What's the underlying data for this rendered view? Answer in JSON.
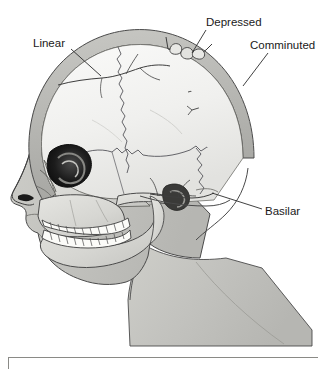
{
  "figure": {
    "background_color": "#ffffff",
    "width": 326,
    "height": 369
  },
  "labels": [
    {
      "id": "linear",
      "text": "Linear",
      "x": 33,
      "y": 47,
      "anchor": "start",
      "leader": {
        "x1": 71,
        "y1": 49,
        "x2": 101,
        "y2": 76
      }
    },
    {
      "id": "depressed",
      "text": "Depressed",
      "x": 206,
      "y": 26,
      "anchor": "start",
      "leader": {
        "x1": 206,
        "y1": 30,
        "x2": 192,
        "y2": 53
      }
    },
    {
      "id": "comminuted",
      "text": "Comminuted",
      "x": 250,
      "y": 49,
      "anchor": "start",
      "leader": {
        "x1": 268,
        "y1": 53,
        "x2": 243,
        "y2": 86
      }
    },
    {
      "id": "basilar",
      "text": "Basilar",
      "x": 265,
      "y": 215,
      "anchor": "start",
      "leader": {
        "x1": 262,
        "y1": 209,
        "x2": 212,
        "y2": 193
      }
    }
  ],
  "anatomy": {
    "regions": [
      {
        "name": "cranial-vault",
        "description": "calvaria interior",
        "color": "#f1f1ef"
      },
      {
        "name": "cranial-rim",
        "description": "outer table of skull",
        "color": "#b9b9b5"
      },
      {
        "name": "facial-skeleton",
        "description": "maxilla, zygoma, mandible",
        "color": "#d8d8d4"
      },
      {
        "name": "soft-tissue-profile",
        "description": "face and neck soft tissue",
        "color": "#c3c3bf"
      },
      {
        "name": "orbit",
        "description": "eye socket",
        "color": "#121212"
      },
      {
        "name": "teeth",
        "description": "upper and lower dentition",
        "color": "#fcfcfa"
      }
    ],
    "sutures": [
      "coronal-suture",
      "squamous-suture",
      "lambdoid-suture"
    ],
    "fracture_sites": [
      {
        "name": "linear-fracture",
        "description": "single crack line across parietal bone"
      },
      {
        "name": "depressed-fracture",
        "description": "inwardly displaced bone fragments at vertex"
      },
      {
        "name": "comminuted-fracture",
        "description": "multiple fragmented bone pieces, occipital-parietal"
      },
      {
        "name": "basilar-fracture",
        "description": "fracture of skull base near temporal bone"
      }
    ]
  },
  "caption_box": {
    "visible": true,
    "x": 8,
    "y": 357,
    "width": 310,
    "border_color": "#888884",
    "text": ""
  },
  "colors": {
    "outline": "#3a3a3a",
    "label_text": "#1a1a1a",
    "leader_line": "#2b2b2b",
    "vault_light": "#f1f1ef",
    "rim_gray": "#b9b9b5",
    "bone_gray": "#d8d8d4",
    "tissue_gray": "#c3c3bf",
    "orbit_dark": "#121212"
  }
}
